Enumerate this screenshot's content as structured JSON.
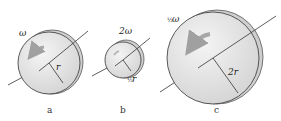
{
  "figure": {
    "panels": [
      {
        "id": "a",
        "caption": "a",
        "omega_label": "ω",
        "radius_label": "r",
        "radius_label_prefix": ""
      },
      {
        "id": "b",
        "caption": "b",
        "omega_label": "2ω",
        "radius_label": "r",
        "radius_label_prefix": "½"
      },
      {
        "id": "c",
        "caption": "c",
        "omega_label": "ω",
        "omega_label_prefix": "½",
        "radius_label": "2r",
        "radius_label_prefix": ""
      }
    ],
    "colors": {
      "disk_fill": "#e6e6e6",
      "disk_edge": "#c8c8c8",
      "outline": "#333333",
      "arrow": "#a8a8a8"
    }
  }
}
